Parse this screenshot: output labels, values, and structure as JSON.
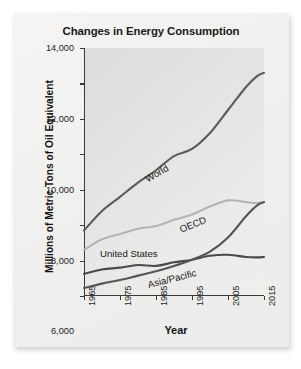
{
  "card": {
    "title": "Changes in Energy Consumption"
  },
  "axes": {
    "ylabel": "Millions of Metric Tons of Oil Equivalent",
    "xlabel": "Year",
    "yticks": [
      "0",
      "2,000",
      "4,000",
      "6,000",
      "8,000",
      "10,000",
      "12,000",
      "14,000"
    ],
    "xticks": [
      "1965",
      "1975",
      "1985",
      "1995",
      "2005",
      "2015"
    ]
  },
  "colors": {
    "world": "#5b5b5b",
    "oecd": "#b4b4b2",
    "united_states": "#4a4a4a",
    "asia_pacific": "#555555",
    "axis": "#3a3a3a",
    "plot_bg": "#e2e2e0",
    "card_bg": "#f1f1ef"
  },
  "chart_data": {
    "type": "line",
    "title": "Changes in Energy Consumption",
    "xlabel": "Year",
    "ylabel": "Millions of Metric Tons of Oil Equivalent",
    "xlim": [
      1965,
      2015
    ],
    "ylim": [
      0,
      14000
    ],
    "xticks": [
      1965,
      1975,
      1985,
      1995,
      2005,
      2015
    ],
    "yticks": [
      0,
      2000,
      4000,
      6000,
      8000,
      10000,
      12000,
      14000
    ],
    "grid": false,
    "legend": "inline-labels",
    "x": [
      1965,
      1970,
      1975,
      1980,
      1985,
      1990,
      1995,
      2000,
      2005,
      2010,
      2013,
      2015
    ],
    "series": [
      {
        "name": "World",
        "label": "World",
        "color": "#5b5b5b",
        "values": [
          3700,
          4800,
          5600,
          6400,
          7100,
          7900,
          8300,
          9200,
          10500,
          11800,
          12400,
          12600
        ]
      },
      {
        "name": "OECD",
        "label": "OECD",
        "color": "#b4b4b2",
        "values": [
          2600,
          3200,
          3500,
          3800,
          3950,
          4300,
          4600,
          5050,
          5400,
          5300,
          5250,
          5300
        ]
      },
      {
        "name": "United States",
        "label": "United States",
        "color": "#4a4a4a",
        "values": [
          1250,
          1500,
          1600,
          1750,
          1700,
          1900,
          2050,
          2270,
          2330,
          2200,
          2180,
          2200
        ]
      },
      {
        "name": "Asia/Pacific",
        "label": "Asia/Pacific",
        "color": "#555555",
        "values": [
          450,
          700,
          900,
          1150,
          1400,
          1700,
          2050,
          2500,
          3300,
          4500,
          5100,
          5300
        ]
      }
    ]
  }
}
